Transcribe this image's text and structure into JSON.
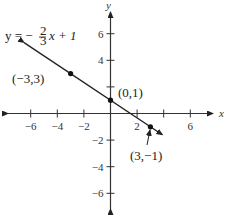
{
  "chart_data": {
    "type": "line",
    "title": "",
    "equation_label": "y = -2/3 x + 1",
    "equation": {
      "prefix": "y = −",
      "frac_num": "2",
      "frac_den": "3",
      "suffix": "x + 1"
    },
    "xlabel": "x",
    "ylabel": "y",
    "xlim": [
      -7.5,
      7.5
    ],
    "ylim": [
      -7.5,
      7.5
    ],
    "grid": false,
    "x_ticks": [
      -6,
      -4,
      -2,
      2,
      6
    ],
    "x_tick_labels": [
      "−6",
      "−4",
      "−2",
      "2",
      "6"
    ],
    "x_ticks_marked": [
      -6,
      -4,
      -2,
      2,
      4,
      6
    ],
    "y_ticks": [
      6,
      4,
      -2,
      -4,
      -6
    ],
    "y_tick_labels": [
      "6",
      "4",
      "−2",
      "−4",
      "−6"
    ],
    "y_ticks_marked": [
      6,
      4,
      2,
      -2,
      -4,
      -6
    ],
    "series": [
      {
        "name": "y = -2/3 x + 1",
        "slope": -0.6667,
        "intercept": 1,
        "x_range": [
          -6.5,
          3.9
        ],
        "points": [
          {
            "x": -3,
            "y": 3,
            "label": "(−3,3)"
          },
          {
            "x": 0,
            "y": 1,
            "label": "(0,1)"
          },
          {
            "x": 3,
            "y": -1,
            "label": "(3,−1)"
          }
        ]
      }
    ],
    "annotations": [
      "arrow pointing to (3,−1)"
    ]
  }
}
